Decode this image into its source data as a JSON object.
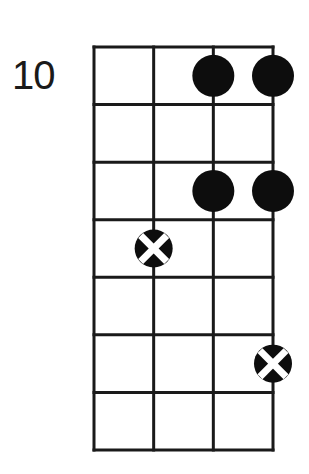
{
  "diagram": {
    "type": "chord-fretboard",
    "start_fret_label": "10",
    "strings": 4,
    "frets": 7,
    "grid": {
      "left": 94,
      "top": 47,
      "right": 273,
      "bottom": 450,
      "line_color": "#1a1a1a",
      "line_width": 3
    },
    "dot_color": "#0d0d0d",
    "x_mark_color": "#ffffff",
    "dot_radius": 21,
    "notes": [
      {
        "string": 3,
        "fret": 1,
        "marker": "filled"
      },
      {
        "string": 4,
        "fret": 1,
        "marker": "filled"
      },
      {
        "string": 3,
        "fret": 3,
        "marker": "filled"
      },
      {
        "string": 4,
        "fret": 3,
        "marker": "filled"
      },
      {
        "string": 2,
        "fret": 4,
        "marker": "x-dot"
      },
      {
        "string": 4,
        "fret": 6,
        "marker": "x-dot"
      }
    ]
  }
}
